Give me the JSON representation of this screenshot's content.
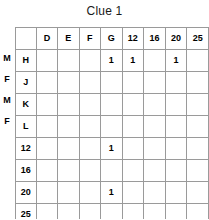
{
  "title": "Clue 1",
  "grid": {
    "corner_label": "",
    "column_headers": [
      "D",
      "E",
      "F",
      "G",
      "12",
      "16",
      "20",
      "25"
    ],
    "letter_columns": [
      "D",
      "E",
      "F",
      "G"
    ],
    "number_columns": [
      "12",
      "16",
      "20",
      "25"
    ],
    "name_rows": [
      {
        "label": "H",
        "gender": "M"
      },
      {
        "label": "J",
        "gender": "F"
      },
      {
        "label": "K",
        "gender": "M"
      },
      {
        "label": "L",
        "gender": "F"
      }
    ],
    "number_rows": [
      {
        "label": "12",
        "gender": ""
      },
      {
        "label": "16",
        "gender": ""
      },
      {
        "label": "20",
        "gender": ""
      },
      {
        "label": "25",
        "gender": ""
      }
    ],
    "mark_symbol": "1",
    "cells": {
      "H": {
        "D": "",
        "E": "",
        "F": "",
        "G": "1",
        "12": "1",
        "16": "",
        "20": "1",
        "25": ""
      },
      "J": {
        "D": "",
        "E": "",
        "F": "",
        "G": "",
        "12": "",
        "16": "",
        "20": "",
        "25": ""
      },
      "K": {
        "D": "",
        "E": "",
        "F": "",
        "G": "",
        "12": "",
        "16": "",
        "20": "",
        "25": ""
      },
      "L": {
        "D": "",
        "E": "",
        "F": "",
        "G": "",
        "12": "",
        "16": "",
        "20": "",
        "25": ""
      },
      "12": {
        "D": "",
        "E": "",
        "F": "",
        "G": "1"
      },
      "16": {
        "D": "",
        "E": "",
        "F": "",
        "G": ""
      },
      "20": {
        "D": "",
        "E": "",
        "F": "",
        "G": "1"
      },
      "25": {
        "D": "",
        "E": "",
        "F": "",
        "G": ""
      }
    }
  },
  "colors": {
    "grid_line": "#9a9a9a",
    "grid_line_heavy": "#3a3a3a",
    "text": "#000000",
    "background": "#ffffff"
  }
}
